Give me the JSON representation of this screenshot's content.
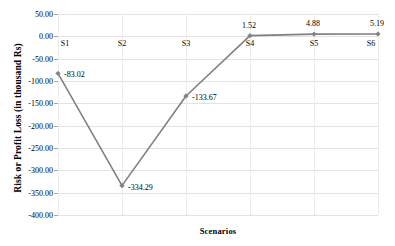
{
  "chart_data": {
    "type": "line",
    "title": "",
    "xlabel": "Scenarios",
    "ylabel": "Risk or Profit Loss (in thousand  Rs)",
    "categories": [
      "S1",
      "S2",
      "S3",
      "S4",
      "S5",
      "S6"
    ],
    "values": [
      -83.02,
      -334.29,
      -133.67,
      1.52,
      4.88,
      5.19
    ],
    "point_labels": [
      "-83.02",
      "-334.29",
      "-133.67",
      "1.52",
      "4.88",
      "5.19"
    ],
    "ylim": [
      -400,
      50
    ],
    "ytick_values": [
      50,
      0,
      -50,
      -100,
      -150,
      -200,
      -250,
      -300,
      -350,
      -400
    ],
    "ytick_labels": [
      "50.00",
      "0.00",
      "-50.00",
      "-100.00",
      "-150.00",
      "-200.00",
      "-250.00",
      "-300.00",
      "-350.00",
      "-400.00"
    ],
    "grid": true,
    "legend": false,
    "series_color": "#808080",
    "gridline_color": "#e2e2e2",
    "axis_color": "#a6a6a6",
    "marker": "diamond",
    "data_label_offsets": [
      {
        "dx": 6,
        "dy": 1
      },
      {
        "dx": 6,
        "dy": 1
      },
      {
        "dx": 6,
        "dy": 1
      },
      {
        "dx": -1,
        "dy": -11
      },
      {
        "dx": -1,
        "dy": -11
      },
      {
        "dx": -1,
        "dy": -11
      }
    ],
    "x_category_label_offsets": [
      {
        "dx": 7,
        "dy": 0
      },
      {
        "dx": 0,
        "dy": 0
      },
      {
        "dx": 0,
        "dy": 0
      },
      {
        "dx": 0,
        "dy": 0
      },
      {
        "dx": 0,
        "dy": 0
      },
      {
        "dx": -7,
        "dy": 0
      }
    ]
  }
}
